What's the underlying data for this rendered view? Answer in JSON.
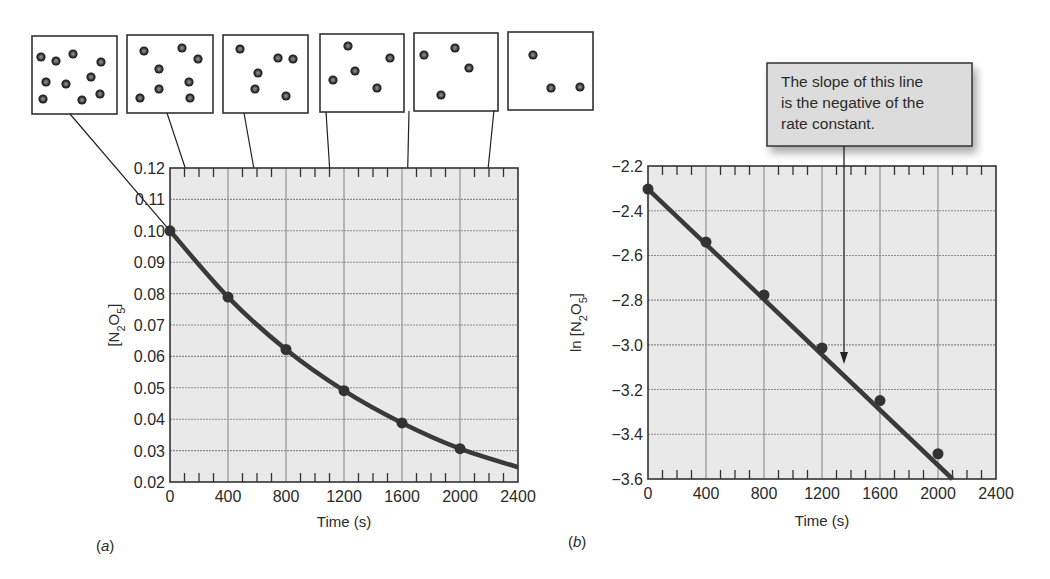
{
  "chart_data": [
    {
      "id": "a",
      "type": "line",
      "panel_label": "(a)",
      "panel_letter": "a",
      "title": "",
      "xlabel": "Time (s)",
      "ylabel": "[N2O5]",
      "ylabel_parts": {
        "prefix": "",
        "main": "[N",
        "sub1": "2",
        "mid": "O",
        "sub2": "5",
        "end": "]"
      },
      "xlim": [
        0,
        2400
      ],
      "ylim": [
        0.02,
        0.12
      ],
      "x_ticks": [
        0,
        400,
        800,
        1200,
        1600,
        2000,
        2400
      ],
      "x_tick_labels": [
        "0",
        "400",
        "800",
        "1200",
        "1600",
        "2000",
        "2400"
      ],
      "y_ticks": [
        0.02,
        0.03,
        0.04,
        0.05,
        0.06,
        0.07,
        0.08,
        0.09,
        0.1,
        0.11,
        0.12
      ],
      "y_tick_labels": [
        "0.02",
        "0.03",
        "0.04",
        "0.05",
        "0.06",
        "0.07",
        "0.08",
        "0.09",
        "0.10",
        "0.11",
        "0.12"
      ],
      "grid": true,
      "x": [
        0,
        400,
        800,
        1200,
        1600,
        2000
      ],
      "values": [
        0.1,
        0.0789,
        0.0622,
        0.0491,
        0.0388,
        0.0306
      ],
      "curve_extends_to": [
        2400,
        0.0247
      ],
      "molecule_boxes": [
        {
          "time": 0,
          "molecule_count": 10
        },
        {
          "time": 400,
          "molecule_count": 8
        },
        {
          "time": 800,
          "molecule_count": 6
        },
        {
          "time": 1200,
          "molecule_count": 5
        },
        {
          "time": 1600,
          "molecule_count": 4
        },
        {
          "time": 2000,
          "molecule_count": 3
        }
      ]
    },
    {
      "id": "b",
      "type": "line",
      "panel_label": "(b)",
      "panel_letter": "b",
      "title": "",
      "xlabel": "Time (s)",
      "ylabel": "ln [N2O5]",
      "ylabel_parts": {
        "prefix": "ln ",
        "main": "[N",
        "sub1": "2",
        "mid": "O",
        "sub2": "5",
        "end": "]"
      },
      "xlim": [
        0,
        2400
      ],
      "ylim": [
        -3.6,
        -2.2
      ],
      "x_ticks": [
        0,
        400,
        800,
        1200,
        1600,
        2000,
        2400
      ],
      "x_tick_labels": [
        "0",
        "400",
        "800",
        "1200",
        "1600",
        "2000",
        "2400"
      ],
      "y_ticks": [
        -3.6,
        -3.4,
        -3.2,
        -3.0,
        -2.8,
        -2.6,
        -2.4,
        -2.2
      ],
      "y_tick_labels": [
        "−3.6",
        "−3.4",
        "−3.2",
        "−3.0",
        "−2.8",
        "−2.6",
        "−2.4",
        "−2.2"
      ],
      "grid": true,
      "x": [
        0,
        400,
        800,
        1200,
        1600,
        2000
      ],
      "values": [
        -2.303,
        -2.54,
        -2.777,
        -3.014,
        -3.249,
        -3.487
      ],
      "line_extends_to": [
        2100,
        -3.6
      ],
      "annotation": {
        "lines": [
          "The slope of this line",
          "is the negative of the",
          "rate constant."
        ],
        "points_to_x": 1360
      }
    }
  ],
  "style": {
    "plot_bg": "#e9e9e9",
    "grid_color": "#8a8a8a",
    "line_color": "#3a3a3a",
    "marker_color": "#333333",
    "annotation_bg": "#dcdcdc",
    "box_border": "#333333"
  }
}
